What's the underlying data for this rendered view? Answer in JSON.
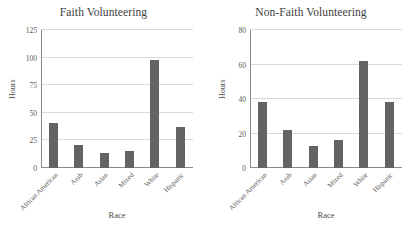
{
  "chart_data": [
    {
      "type": "bar",
      "title": "Faith Volunteering",
      "xlabel": "Race",
      "ylabel": "Hours",
      "categories": [
        "African American",
        "Arab",
        "Asian",
        "Mixed",
        "White",
        "Hispanic"
      ],
      "values": [
        41,
        21,
        14,
        15,
        98,
        37
      ],
      "ylim": [
        0,
        125
      ],
      "yticks": [
        0,
        25,
        50,
        75,
        100,
        125
      ],
      "grid": true,
      "legend": "none",
      "bar_color": "#636363"
    },
    {
      "type": "bar",
      "title": "Non-Faith Volunteering",
      "xlabel": "Race",
      "ylabel": "Hours",
      "categories": [
        "African American",
        "Arab",
        "Asian",
        "Mixed",
        "White",
        "Hispanic"
      ],
      "values": [
        38,
        22,
        13,
        16,
        62,
        38
      ],
      "ylim": [
        0,
        80
      ],
      "yticks": [
        0,
        20,
        40,
        60,
        80
      ],
      "grid": true,
      "legend": "none",
      "bar_color": "#636363"
    }
  ]
}
